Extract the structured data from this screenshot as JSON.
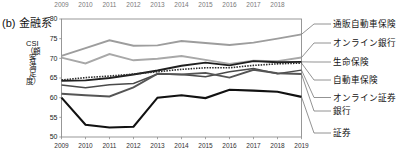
{
  "figure": {
    "caption": "(b) 金融系",
    "y_axis_title": "CSI（顧客満足度）"
  },
  "chart_data": {
    "type": "line",
    "title": "(b) 金融系",
    "xlabel": "",
    "ylabel": "CSI（顧客満足度）",
    "x": [
      2009,
      2010,
      2011,
      2012,
      2013,
      2014,
      2015,
      2016,
      2017,
      2018,
      2019
    ],
    "xlim": [
      2009,
      2019
    ],
    "ylim": [
      50,
      80
    ],
    "yticks": [
      50,
      55,
      60,
      65,
      70,
      75,
      80
    ],
    "xticks_top": [
      2009,
      2010,
      2011,
      2012,
      2013,
      2014,
      2015,
      2016,
      2017,
      2018
    ],
    "xticks_bottom": [
      2009,
      2010,
      2011,
      2012,
      2013,
      2014,
      2015,
      2016,
      2017,
      2018,
      2019
    ],
    "grid": false,
    "legend_position": "right-outside",
    "series": [
      {
        "name": "通販自動車保険",
        "color": "#9d9d9d",
        "style": "solid",
        "width": 1.9,
        "values": [
          70.6,
          72.6,
          74.6,
          73.2,
          73.3,
          74.4,
          73.9,
          73.4,
          74.0,
          75.0,
          76.1
        ]
      },
      {
        "name": "オンライン銀行",
        "color": "#a8a8a8",
        "style": "solid",
        "width": 1.9,
        "values": [
          70.2,
          68.7,
          71.1,
          69.5,
          69.9,
          70.6,
          69.6,
          68.6,
          69.4,
          69.3,
          70.2
        ]
      },
      {
        "name": "生命保険",
        "color": "#1f1f1f",
        "style": "solid",
        "width": 1.9,
        "values": [
          64.3,
          64.4,
          65.0,
          65.9,
          66.9,
          68.1,
          68.9,
          68.2,
          69.3,
          69.0,
          69.1
        ]
      },
      {
        "name": "自動車保険",
        "color": "#2b2b2b",
        "style": "dotted",
        "width": 1.6,
        "values": [
          64.5,
          65.1,
          65.5,
          66.0,
          66.6,
          67.2,
          67.6,
          67.6,
          68.2,
          68.6,
          68.8
        ]
      },
      {
        "name": "オンライン証券",
        "color": "#4a4a4a",
        "style": "solid",
        "width": 1.5,
        "values": [
          63.2,
          62.5,
          63.3,
          63.6,
          66.0,
          65.9,
          65.3,
          66.6,
          67.4,
          66.1,
          67.0
        ]
      },
      {
        "name": "銀行",
        "color": "#555555",
        "style": "solid",
        "width": 1.9,
        "values": [
          61.0,
          60.6,
          60.3,
          62.6,
          66.1,
          65.9,
          66.3,
          65.1,
          67.1,
          66.2,
          66.0
        ]
      },
      {
        "name": "証券",
        "color": "#111111",
        "style": "solid",
        "width": 2.1,
        "values": [
          60.0,
          53.1,
          52.4,
          52.6,
          60.0,
          60.6,
          59.9,
          62.0,
          61.8,
          61.5,
          60.2
        ]
      }
    ]
  },
  "axis": {
    "y_labels": [
      "80",
      "75",
      "70",
      "65",
      "60",
      "55",
      "50"
    ],
    "x_labels_top": [
      "2009",
      "2010",
      "2011",
      "2012",
      "2013",
      "2014",
      "2015",
      "2016",
      "2017",
      "2018"
    ],
    "x_labels_bottom": [
      "2009",
      "2010",
      "2011",
      "2012",
      "2013",
      "2014",
      "2015",
      "2016",
      "2017",
      "2018",
      "2019"
    ]
  },
  "legend": {
    "items": [
      {
        "label": "通販自動車保険"
      },
      {
        "label": "オンライン銀行"
      },
      {
        "label": "生命保険"
      },
      {
        "label": "自動車保険"
      },
      {
        "label": "オンライン証券"
      },
      {
        "label": "銀行"
      },
      {
        "label": "証券"
      }
    ]
  }
}
